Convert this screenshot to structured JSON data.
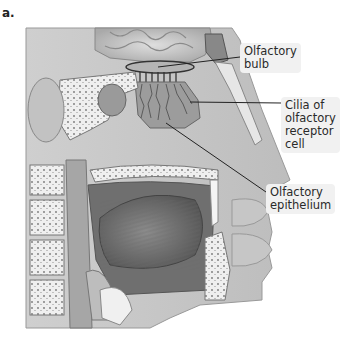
{
  "figure": {
    "panel_letter": "a.",
    "labels": [
      {
        "id": "olfactory-bulb",
        "lines": [
          "Olfactory",
          "bulb"
        ]
      },
      {
        "id": "cilia",
        "lines": [
          "Cilia of",
          "olfactory",
          "receptor",
          "cell"
        ]
      },
      {
        "id": "olfactory-epithelium",
        "lines": [
          "Olfactory",
          "epithelium"
        ]
      }
    ]
  },
  "colors": {
    "tissue_light": "#d9d9d9",
    "tissue_mid": "#a8a8a8",
    "tissue_dark": "#5e5e5e",
    "bone": "#ececec",
    "label_bg": "#f1f1f1",
    "leader_line": "#222222"
  }
}
